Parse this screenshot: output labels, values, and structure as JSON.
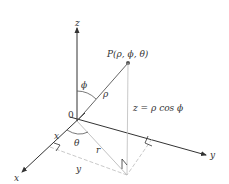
{
  "diagram": {
    "labels": {
      "z_axis": "z",
      "x_axis": "x",
      "y_axis": "y",
      "origin": "0",
      "point": "P(ρ, ϕ, θ)",
      "phi": "ϕ",
      "rho": "ρ",
      "theta": "θ",
      "r": "r",
      "x_coord": "x",
      "y_coord": "y",
      "z_equation": "z = ρ cos ϕ"
    },
    "colors": {
      "axis": "#333333",
      "dashed": "#bbbbbb",
      "point": "#555555",
      "text": "#333333"
    }
  }
}
